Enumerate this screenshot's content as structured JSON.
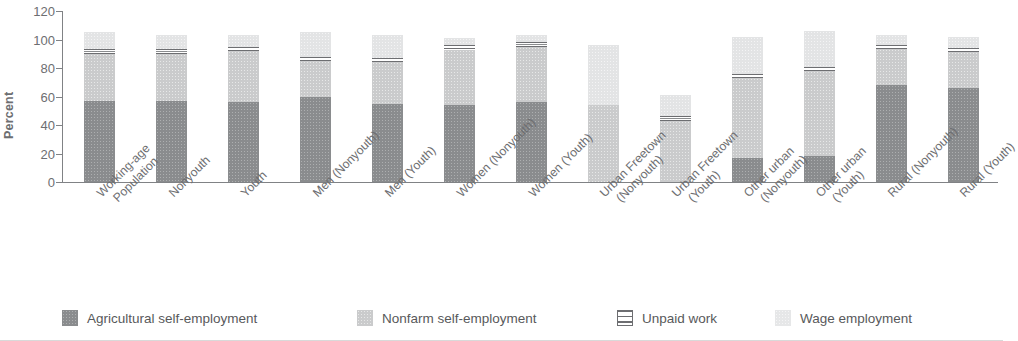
{
  "chart_data": {
    "type": "bar",
    "subtype": "stacked-bar",
    "title": "",
    "xlabel": "",
    "ylabel": "Percent",
    "ylim": [
      0,
      120
    ],
    "yticks": [
      0,
      20,
      40,
      60,
      80,
      100,
      120
    ],
    "ytick_labels": [
      "0",
      "20",
      "40",
      "60",
      "80",
      "100",
      "120"
    ],
    "grid": false,
    "legend_position": "bottom",
    "stacked": true,
    "categories": [
      "Working-age Population",
      "Nonyouth",
      "Youth",
      "Men (Nonyouth)",
      "Men (Youth)",
      "Women (Nonyouth)",
      "Women (Youth)",
      "Urban Freetown (Nonyouth)",
      "Urban Freetown (Youth)",
      "Other urban (Nonyouth)",
      "Other urban (Youth)",
      "Rural (Nonyouth)",
      "Rural (Youth)"
    ],
    "category_lines": [
      [
        "Working-age",
        "Population"
      ],
      [
        "Nonyouth"
      ],
      [
        "Youth"
      ],
      [
        "Men (Nonyouth)"
      ],
      [
        "Men (Youth)"
      ],
      [
        "Women (Nonyouth)"
      ],
      [
        "Women (Youth)"
      ],
      [
        "Urban Freetown",
        "(Nonyouth)"
      ],
      [
        "Urban Freetown",
        "(Youth)"
      ],
      [
        "Other urban",
        "(Nonyouth)"
      ],
      [
        "Other urban",
        "(Youth)"
      ],
      [
        "Rural (Nonyouth)"
      ],
      [
        "Rural (Youth)"
      ]
    ],
    "series": [
      {
        "name": "Agricultural self-employment",
        "color": "#8a8c8e",
        "values": [
          57,
          57,
          56,
          60,
          55,
          54,
          56,
          0,
          0,
          17,
          18,
          68,
          66
        ]
      },
      {
        "name": "Nonfarm self-employment",
        "color": "#cacbcc",
        "values": [
          33,
          33,
          36,
          25,
          29,
          39,
          39,
          54,
          43,
          56,
          60,
          25,
          25
        ]
      },
      {
        "name": "Unpaid work",
        "color": "#ffffff",
        "pattern": "horizontal-stripes",
        "values": [
          3,
          3,
          3,
          3,
          3,
          3,
          3,
          0,
          3,
          3,
          3,
          3,
          3
        ]
      },
      {
        "name": "Wage employment",
        "color": "#e3e4e5",
        "values": [
          12,
          10,
          8,
          17,
          16,
          5,
          5,
          42,
          15,
          26,
          25,
          7,
          8
        ]
      }
    ],
    "totals": [
      105,
      103,
      103,
      105,
      103,
      101,
      103,
      96,
      61,
      102,
      106,
      103,
      102
    ]
  },
  "axis": {
    "y_label": "Percent",
    "y_ticks": [
      "120",
      "100",
      "80",
      "60",
      "40",
      "20",
      "0"
    ]
  },
  "legend": {
    "items": [
      {
        "label": "Agricultural self-employment",
        "swatch": "agri"
      },
      {
        "label": "Nonfarm self-employment",
        "swatch": "nonfarm"
      },
      {
        "label": "Unpaid work",
        "swatch": "unpaid"
      },
      {
        "label": "Wage employment",
        "swatch": "wage"
      }
    ]
  }
}
